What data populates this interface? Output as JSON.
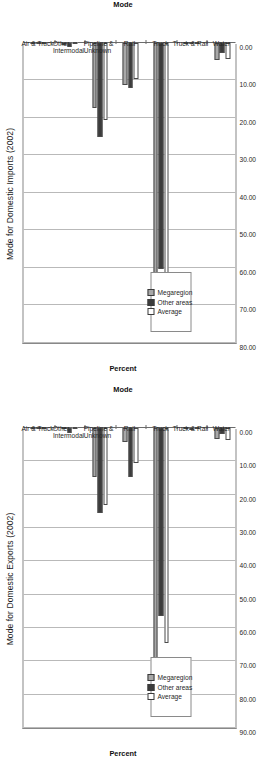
{
  "page": {
    "background": "#ffffff",
    "orientation": "rotated-90-ccw"
  },
  "colors": {
    "megaregion": "#a8a8a8",
    "other_areas": "#3c3c3c",
    "average": "#ffffff",
    "gridline": "#b9b9b9",
    "axis": "#6b6b6b",
    "text": "#262626"
  },
  "charts": [
    {
      "id": "imports",
      "title": "Mode for Domestic Imports (2002)",
      "ylabel": "Percent",
      "xlabel": "Mode",
      "legend": {
        "items": [
          {
            "label": "Megaregion",
            "key": "mega"
          },
          {
            "label": "Other areas",
            "key": "other"
          },
          {
            "label": "Average",
            "key": "avg"
          }
        ]
      },
      "yticks": [
        "80.00",
        "70.00",
        "60.00",
        "50.00",
        "40.00",
        "30.00",
        "20.00",
        "10.00",
        "0.00"
      ],
      "chart_data": {
        "type": "bar",
        "title": "Mode for Domestic Imports (2002)",
        "xlabel": "Mode",
        "ylabel": "Percent",
        "ylim": [
          0,
          80
        ],
        "ytick_step": 10,
        "grid": true,
        "legend_position": "inside-left",
        "orientation": "horizontal-bars-rotated",
        "categories": [
          "Air & Truck",
          "Other Intermodal",
          "Pipeline & Unknown",
          "Rail",
          "Truck",
          "Truck & Rail",
          "Water"
        ],
        "series": [
          {
            "name": "Megaregion",
            "values": [
              0.1,
              0.6,
              17.4,
              11.2,
              68.6,
              0.3,
              4.6
            ]
          },
          {
            "name": "Other areas",
            "values": [
              0.1,
              1.1,
              25.0,
              12.0,
              60.3,
              0.4,
              2.6
            ]
          },
          {
            "name": "Average",
            "values": [
              0.1,
              0.4,
              20.5,
              9.6,
              66.0,
              0.3,
              4.3
            ]
          }
        ]
      }
    },
    {
      "id": "exports",
      "title": "Mode for Domestic Exports (2002)",
      "ylabel": "Percent",
      "xlabel": "Mode",
      "legend": {
        "items": [
          {
            "label": "Megaregion",
            "key": "mega"
          },
          {
            "label": "Other areas",
            "key": "other"
          },
          {
            "label": "Average",
            "key": "avg"
          }
        ]
      },
      "yticks": [
        "90.00",
        "80.00",
        "70.00",
        "60.00",
        "50.00",
        "40.00",
        "30.00",
        "20.00",
        "10.00",
        "0.00"
      ],
      "chart_data": {
        "type": "bar",
        "title": "Mode for Domestic Exports (2002)",
        "xlabel": "Mode",
        "ylabel": "Percent",
        "ylim": [
          0,
          90
        ],
        "ytick_step": 10,
        "grid": true,
        "legend_position": "inside-left",
        "orientation": "horizontal-bars-rotated",
        "categories": [
          "Air & Truck",
          "Other Intermodal",
          "Pipeline & Unknown",
          "Rail",
          "Truck",
          "Truck & Rail",
          "Water"
        ],
        "series": [
          {
            "name": "Megaregion",
            "values": [
              0.1,
              0.3,
              14.8,
              4.3,
              77.0,
              0.4,
              3.2
            ]
          },
          {
            "name": "Other areas",
            "values": [
              0.1,
              1.4,
              25.4,
              14.6,
              56.5,
              0.5,
              1.8
            ]
          },
          {
            "name": "Average",
            "values": [
              0.1,
              0.4,
              23.0,
              10.6,
              64.5,
              0.4,
              3.6
            ]
          }
        ]
      }
    }
  ]
}
